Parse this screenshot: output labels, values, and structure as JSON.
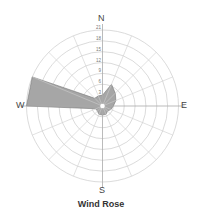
{
  "chart_data": {
    "type": "wind_rose",
    "title": "Wind Rose",
    "directions": [
      "N",
      "NNE",
      "NE",
      "ENE",
      "E",
      "ESE",
      "SE",
      "SSE",
      "S",
      "SSW",
      "SW",
      "WSW",
      "W",
      "WNW",
      "NW",
      "NNW"
    ],
    "values": [
      3,
      6.5,
      5,
      4,
      3,
      2.5,
      2,
      2.5,
      2.5,
      2.5,
      2,
      2,
      21,
      21,
      3,
      3
    ],
    "radial_ticks": [
      3,
      6,
      9,
      12,
      15,
      18,
      21
    ],
    "rmax": 21,
    "cardinal_labels": {
      "n": "N",
      "e": "E",
      "s": "S",
      "w": "W"
    },
    "fill_color": "#a6a6a6",
    "edge_color": "#777777",
    "grid_color": "#cccccc",
    "grid": true
  }
}
